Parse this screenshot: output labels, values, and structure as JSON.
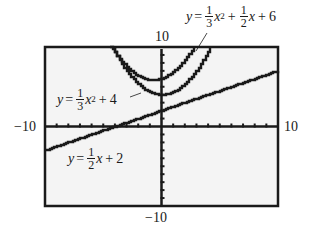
{
  "window": {
    "xmin": -10,
    "xmax": 10,
    "ymin": -10,
    "ymax": 10,
    "xscl": 1,
    "yscl": 1
  },
  "labels": {
    "top": "10",
    "bottom": "-10",
    "left": "-10",
    "right": "10"
  },
  "equations": {
    "shifted_parabola": {
      "y": "y",
      "eq": "=",
      "a_num": "1",
      "a_den": "3",
      "x2": "x",
      "pow": "2",
      "plus1": "+",
      "b_num": "1",
      "b_den": "2",
      "x1": "x",
      "plus2": "+",
      "c": "6"
    },
    "parabola": {
      "y": "y",
      "eq": "=",
      "a_num": "1",
      "a_den": "3",
      "x2": "x",
      "pow": "2",
      "plus": "+",
      "c": "4"
    },
    "line": {
      "y": "y",
      "eq": "=",
      "m_num": "1",
      "m_den": "2",
      "x": "x",
      "plus": "+",
      "c": "2"
    }
  },
  "colors": {
    "ink": "#1a1a1a",
    "screen": "#f4f4f4",
    "frame": "#1a1a1a"
  },
  "chart_data": {
    "type": "line",
    "title": "",
    "xlabel": "",
    "ylabel": "",
    "xlim": [
      -10,
      10
    ],
    "ylim": [
      -10,
      10
    ],
    "grid": false,
    "tick_labels": {
      "x": [
        "-10",
        "10"
      ],
      "y": [
        "-10",
        "10"
      ]
    },
    "series": [
      {
        "name": "y = 1/3 x^2 + 1/2 x + 6",
        "a": 0.3333,
        "b": 0.5,
        "c": 6,
        "x": [
          -6.2,
          -5,
          -4,
          -3,
          -2,
          -1,
          -0.75,
          0,
          1,
          2,
          3,
          4,
          4.7
        ],
        "y": [
          15.7,
          11.8,
          9.3,
          7.5,
          6.3,
          5.8,
          5.8,
          6,
          6.8,
          8.3,
          10.5,
          13.3,
          15.7
        ]
      },
      {
        "name": "y = 1/3 x^2 + 4",
        "a": 0.3333,
        "b": 0,
        "c": 4,
        "x": [
          -6,
          -5,
          -4,
          -3,
          -2,
          -1,
          0,
          1,
          2,
          3,
          4,
          5,
          6
        ],
        "y": [
          16,
          12.3,
          9.3,
          7,
          5.3,
          4.3,
          4,
          4.3,
          5.3,
          7,
          9.3,
          12.3,
          16
        ]
      },
      {
        "name": "y = 1/2 x + 2",
        "a": 0,
        "b": 0.5,
        "c": 2,
        "x": [
          -10,
          -4,
          0,
          10
        ],
        "y": [
          -3,
          0,
          2,
          7
        ]
      }
    ],
    "annotations": [
      "y = 1/3 x^2 + 1/2 x + 6",
      "y = 1/3 x^2 + 4",
      "y = 1/2 x + 2"
    ]
  }
}
